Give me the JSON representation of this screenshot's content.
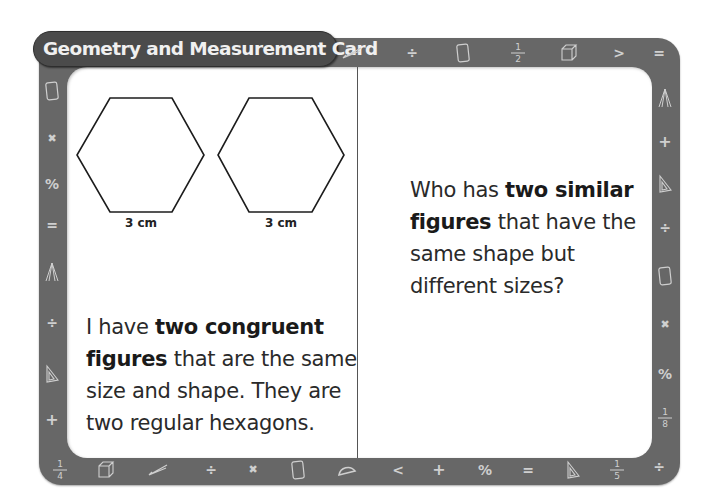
{
  "card": {
    "title": "Geometry and Measurement Card",
    "colors": {
      "frame": "#676767",
      "title_pill": "#4b4b4b",
      "title_text": "#f0f0f0",
      "icon": "#cfcfcf",
      "panel": "#ffffff",
      "text": "#2a2a2a"
    }
  },
  "left_panel": {
    "figures": [
      {
        "shape": "regular-hexagon",
        "label": "3 cm"
      },
      {
        "shape": "regular-hexagon",
        "label": "3 cm"
      }
    ],
    "statement": {
      "lines": [
        [
          {
            "t": "I have ",
            "b": false
          },
          {
            "t": "two congruent",
            "b": true
          }
        ],
        [
          {
            "t": "figures",
            "b": true
          },
          {
            "t": " that are the same",
            "b": false
          }
        ],
        [
          {
            "t": "size and shape. They are",
            "b": false
          }
        ],
        [
          {
            "t": "two regular hexagons.",
            "b": false
          }
        ]
      ]
    }
  },
  "right_panel": {
    "question": {
      "lines": [
        [
          {
            "t": "Who has ",
            "b": false
          },
          {
            "t": "two similar",
            "b": true
          }
        ],
        [
          {
            "t": "figures",
            "b": true
          },
          {
            "t": " that have the",
            "b": false
          }
        ],
        [
          {
            "t": "same shape but",
            "b": false
          }
        ],
        [
          {
            "t": "different sizes?",
            "b": false
          }
        ]
      ]
    }
  },
  "border_icons": {
    "top": [
      {
        "name": "ruler-pencil-icon",
        "glyph": "pencil",
        "x": 352,
        "y": 53
      },
      {
        "name": "divide-icon",
        "glyph": "÷",
        "x": 412,
        "y": 53
      },
      {
        "name": "tablet-icon",
        "glyph": "tablet",
        "x": 463,
        "y": 53
      },
      {
        "name": "fraction-half-icon",
        "glyph": "frac",
        "num": "1",
        "den": "2",
        "x": 518,
        "y": 53
      },
      {
        "name": "cube-icon",
        "glyph": "cube",
        "x": 569,
        "y": 53
      },
      {
        "name": "greater-than-icon",
        "glyph": ">",
        "x": 619,
        "y": 53
      },
      {
        "name": "equals-icon",
        "glyph": "=",
        "x": 659,
        "y": 53
      }
    ],
    "left": [
      {
        "name": "tablet-icon",
        "glyph": "tablet",
        "x": 52,
        "y": 91
      },
      {
        "name": "multiply-icon",
        "glyph": "x",
        "x": 52,
        "y": 139
      },
      {
        "name": "percent-icon",
        "glyph": "%",
        "x": 52,
        "y": 184
      },
      {
        "name": "equals-icon",
        "glyph": "=",
        "x": 52,
        "y": 225
      },
      {
        "name": "compass-icon",
        "glyph": "compass",
        "x": 52,
        "y": 272
      },
      {
        "name": "divide-icon",
        "glyph": "÷",
        "x": 52,
        "y": 323
      },
      {
        "name": "set-square-icon",
        "glyph": "triangle",
        "x": 52,
        "y": 374
      },
      {
        "name": "plus-icon",
        "glyph": "+",
        "x": 52,
        "y": 420
      }
    ],
    "right": [
      {
        "name": "compass-icon",
        "glyph": "compass",
        "x": 665,
        "y": 98
      },
      {
        "name": "plus-icon",
        "glyph": "+",
        "x": 665,
        "y": 142
      },
      {
        "name": "set-square-icon",
        "glyph": "triangle",
        "x": 665,
        "y": 184
      },
      {
        "name": "divide-icon",
        "glyph": "÷",
        "x": 665,
        "y": 228
      },
      {
        "name": "tablet-icon",
        "glyph": "tablet",
        "x": 665,
        "y": 276
      },
      {
        "name": "multiply-icon",
        "glyph": "x",
        "x": 665,
        "y": 325
      },
      {
        "name": "percent-icon",
        "glyph": "%",
        "x": 665,
        "y": 374
      },
      {
        "name": "fraction-eighth-icon",
        "glyph": "frac",
        "num": "1",
        "den": "8",
        "x": 665,
        "y": 418
      },
      {
        "name": "divide-icon",
        "glyph": "÷",
        "x": 659,
        "y": 467
      }
    ],
    "bottom": [
      {
        "name": "fraction-quarter-icon",
        "glyph": "frac",
        "num": "1",
        "den": "4",
        "x": 60,
        "y": 470
      },
      {
        "name": "cube-icon",
        "glyph": "cube",
        "x": 106,
        "y": 470
      },
      {
        "name": "ruler-pencil-icon",
        "glyph": "pencil",
        "x": 158,
        "y": 470
      },
      {
        "name": "divide-icon",
        "glyph": "÷",
        "x": 211,
        "y": 470
      },
      {
        "name": "multiply-icon",
        "glyph": "x",
        "x": 253,
        "y": 470
      },
      {
        "name": "tablet-icon",
        "glyph": "tablet",
        "x": 298,
        "y": 470
      },
      {
        "name": "protractor-icon",
        "glyph": "protractor",
        "x": 347,
        "y": 470
      },
      {
        "name": "less-than-icon",
        "glyph": "<",
        "x": 398,
        "y": 470
      },
      {
        "name": "plus-icon",
        "glyph": "+",
        "x": 439,
        "y": 470
      },
      {
        "name": "percent-icon",
        "glyph": "%",
        "x": 485,
        "y": 470
      },
      {
        "name": "equals-icon",
        "glyph": "=",
        "x": 528,
        "y": 470
      },
      {
        "name": "set-square-icon",
        "glyph": "triangle",
        "x": 573,
        "y": 470
      },
      {
        "name": "fraction-fifth-icon",
        "glyph": "frac",
        "num": "1",
        "den": "5",
        "x": 617,
        "y": 470
      }
    ]
  }
}
